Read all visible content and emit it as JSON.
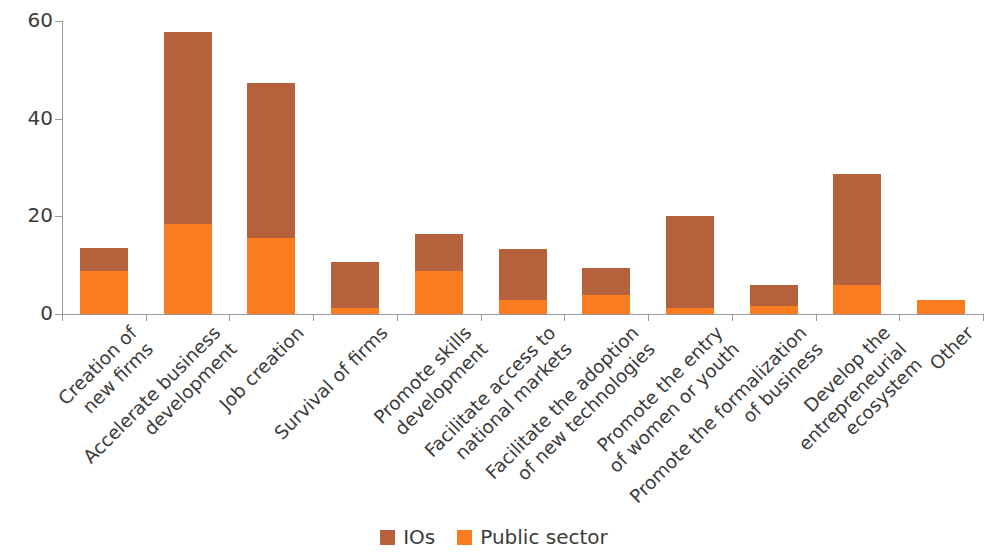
{
  "chart_data": {
    "type": "bar",
    "stacked": true,
    "title": "",
    "xlabel": "",
    "ylabel": "Percent",
    "ylim": [
      0,
      60
    ],
    "yticks": [
      0,
      20,
      40,
      60
    ],
    "ytick_labels": [
      "0",
      "20",
      "40",
      "60"
    ],
    "grid": false,
    "legend_position": "bottom-center",
    "categories": [
      "Creation of\nnew firms",
      "Accelerate business\ndevelopment",
      "Job creation",
      "Survival of firms",
      "Promote skills\ndevelopment",
      "Facilitate access to\nnational markets",
      "Facilitate the adoption\nof new technologies",
      "Promote the entry\nof women or youth",
      "Promote the formalization\nof business",
      "Develop the\nentrepreneurial\necosystem",
      "Other"
    ],
    "series": [
      {
        "name": "Public sector",
        "color": "#f97d20",
        "values": [
          8.8,
          18.5,
          15.5,
          1.2,
          8.8,
          2.8,
          3.9,
          1.2,
          1.6,
          6.0,
          2.9
        ]
      },
      {
        "name": "IOs",
        "color": "#b4613c",
        "values": [
          4.8,
          39.2,
          31.8,
          9.4,
          7.6,
          10.5,
          5.5,
          18.9,
          4.3,
          22.6,
          0.0
        ]
      }
    ],
    "totals": [
      13.6,
      57.7,
      47.3,
      10.6,
      16.4,
      13.3,
      9.4,
      20.1,
      5.9,
      28.6,
      2.9
    ]
  },
  "legend": {
    "entries": [
      {
        "label": "IOs",
        "color": "#b4613c"
      },
      {
        "label": "Public sector",
        "color": "#f97d20"
      }
    ]
  }
}
